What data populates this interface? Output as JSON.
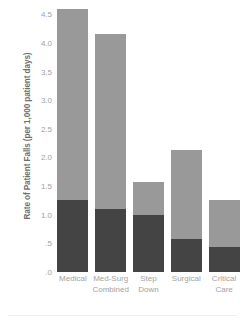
{
  "chart_data": {
    "type": "bar",
    "title": "",
    "subtitle": "",
    "xlabel": "",
    "ylabel": "Rate of Patient Falls (per 1,000 patient days)",
    "stacked": true,
    "grid": false,
    "legend": "none",
    "ylim": [
      0,
      4.75
    ],
    "yticks": [
      0,
      0.5,
      1.0,
      1.5,
      2.0,
      2.5,
      3.0,
      3.5,
      4.0,
      4.5
    ],
    "ytick_labels": [
      ".0",
      ".5",
      "1.0",
      "1.5",
      "2.0",
      "2.5",
      "3.0",
      "3.5",
      "4.0",
      "4.5"
    ],
    "categories": [
      "Medical",
      "Med-Surg Combined",
      "Step Down",
      "Surgical",
      "Critical Care"
    ],
    "category_lines": [
      [
        "Medical"
      ],
      [
        "Med-Surg",
        "Combined"
      ],
      [
        "Step",
        "Down"
      ],
      [
        "Surgical"
      ],
      [
        "Critical",
        "Care"
      ]
    ],
    "series": [
      {
        "name": "lower-segment",
        "color": "#444444",
        "values": [
          1.25,
          1.1,
          1.0,
          0.58,
          0.44
        ]
      },
      {
        "name": "upper-segment",
        "color": "#999999",
        "values": [
          3.35,
          3.05,
          0.57,
          1.55,
          0.82
        ]
      }
    ],
    "totals": [
      4.6,
      4.15,
      1.57,
      2.13,
      1.26
    ]
  },
  "colors": {
    "upper_segment": "#999999",
    "lower_segment": "#444444",
    "tick_text": "#a2a2a2",
    "axis_title_text": "#6f6f6f",
    "background": "#ffffff",
    "rule": "#ededed"
  }
}
